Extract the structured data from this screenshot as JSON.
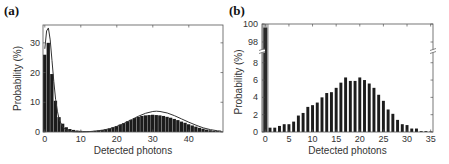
{
  "panels": {
    "a": {
      "label": "(a)"
    },
    "b": {
      "label": "(b)"
    }
  },
  "colors": {
    "bar": "#1c1c1c",
    "bar_b_zero": "#2a2a2a",
    "bar_b_zero_border": "#9a9a9a",
    "fit_line": "#333333",
    "axis": "#555555"
  },
  "chart_data": [
    {
      "panel": "(a)",
      "type": "bar",
      "title": "",
      "xlabel": "Detected photons",
      "ylabel": "Probability (%)",
      "xlim": [
        -0.5,
        49.5
      ],
      "ylim": [
        0,
        36
      ],
      "xticks": [
        0,
        10,
        20,
        30,
        40
      ],
      "yticks": [
        0,
        10,
        20,
        30
      ],
      "grid": false,
      "legend": null,
      "x": [
        0,
        1,
        2,
        3,
        4,
        5,
        6,
        7,
        8,
        9,
        10,
        11,
        12,
        13,
        14,
        15,
        16,
        17,
        18,
        19,
        20,
        21,
        22,
        23,
        24,
        25,
        26,
        27,
        28,
        29,
        30,
        31,
        32,
        33,
        34,
        35,
        36,
        37,
        38,
        39,
        40,
        41,
        42,
        43,
        44,
        45,
        46,
        47,
        48,
        49
      ],
      "values": [
        26,
        30,
        19.5,
        10.5,
        5,
        2.8,
        1.6,
        1.0,
        0.7,
        0.5,
        0.4,
        0.3,
        0.3,
        0.3,
        0.4,
        0.5,
        0.7,
        0.9,
        1.2,
        1.6,
        2.0,
        2.5,
        3.0,
        3.6,
        4.1,
        4.7,
        5.1,
        5.4,
        5.6,
        5.7,
        5.8,
        5.7,
        5.6,
        5.4,
        5.1,
        4.8,
        4.4,
        4.0,
        3.5,
        3.1,
        2.6,
        2.2,
        1.8,
        1.4,
        1.1,
        0.8,
        0.6,
        0.4,
        0.3,
        0.2
      ],
      "fit_curve": {
        "description": "Bimodal fit (two Poisson-like lobes)",
        "x": [
          0,
          0.5,
          1,
          1.5,
          2,
          2.5,
          3,
          3.5,
          4,
          5,
          6,
          7,
          8,
          10,
          12,
          14,
          16,
          18,
          20,
          22,
          24,
          26,
          28,
          30,
          31,
          32,
          34,
          36,
          38,
          40,
          42,
          44,
          46,
          48,
          49
        ],
        "y": [
          28,
          34,
          35,
          31,
          24,
          17,
          11,
          7,
          4.2,
          1.6,
          0.6,
          0.2,
          0.1,
          0.05,
          0.1,
          0.3,
          0.6,
          1.1,
          1.9,
          2.9,
          4.1,
          5.3,
          6.3,
          6.9,
          7.0,
          6.9,
          6.4,
          5.5,
          4.4,
          3.3,
          2.3,
          1.4,
          0.8,
          0.4,
          0.3
        ]
      }
    },
    {
      "panel": "(b)",
      "type": "bar",
      "title": "",
      "xlabel": "Detected photons",
      "ylabel": "Probability (%)",
      "xlim": [
        -0.7,
        35.5
      ],
      "ylim_lower": [
        0,
        9
      ],
      "ylim_upper": [
        97,
        100
      ],
      "axis_break": true,
      "xticks": [
        0,
        5,
        10,
        15,
        20,
        25,
        30,
        35
      ],
      "yticks_lower": [
        0,
        2,
        4,
        6,
        8
      ],
      "yticks_upper": [
        98,
        100
      ],
      "grid": false,
      "legend": null,
      "x": [
        0,
        1,
        2,
        3,
        4,
        5,
        6,
        7,
        8,
        9,
        10,
        11,
        12,
        13,
        14,
        15,
        16,
        17,
        18,
        19,
        20,
        21,
        22,
        23,
        24,
        25,
        26,
        27,
        28,
        29,
        30,
        31,
        32,
        33,
        34,
        35
      ],
      "values": [
        99.6,
        0.5,
        0.5,
        0.7,
        0.9,
        0.9,
        1.2,
        1.9,
        2.2,
        2.9,
        3.1,
        3.4,
        4.0,
        4.5,
        4.6,
        5.1,
        5.7,
        6.3,
        5.9,
        5.9,
        6.3,
        6.0,
        5.6,
        5.1,
        4.3,
        3.6,
        2.6,
        2.1,
        1.4,
        0.9,
        0.8,
        0.4,
        0.4,
        0.1,
        0.1,
        0.05
      ]
    }
  ]
}
